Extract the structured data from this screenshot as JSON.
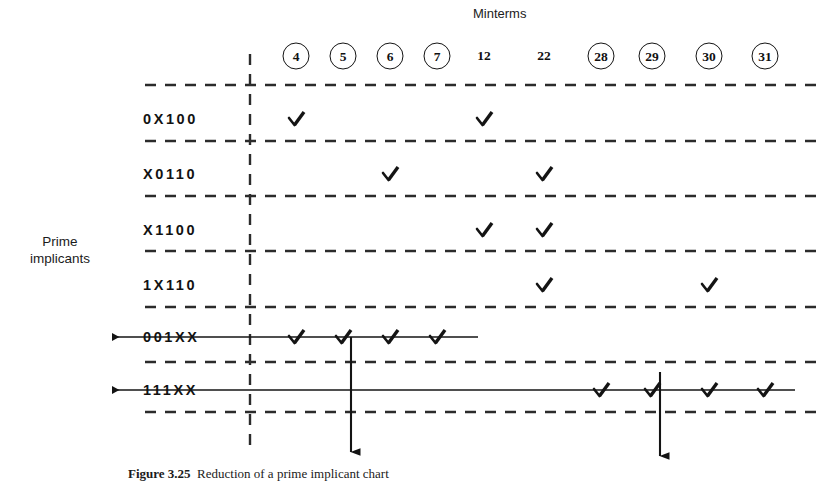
{
  "figure": {
    "header_label": "Minterms",
    "side_label_line1": "Prime",
    "side_label_line2": "implicants",
    "caption_bold": "Figure 3.25",
    "caption_text": "Reduction of a prime implicant chart",
    "ink_color": "#141414",
    "background_color": "#ffffff"
  },
  "chart_data": {
    "type": "table",
    "xlabel": "Minterms",
    "ylabel": "Prime implicants",
    "columns": [
      {
        "label": "4",
        "circled": true,
        "x": 296
      },
      {
        "label": "5",
        "circled": true,
        "x": 343
      },
      {
        "label": "6",
        "circled": true,
        "x": 390
      },
      {
        "label": "7",
        "circled": true,
        "x": 437
      },
      {
        "label": "12",
        "circled": false,
        "x": 484
      },
      {
        "label": "22",
        "circled": false,
        "x": 544
      },
      {
        "label": "28",
        "circled": true,
        "x": 601
      },
      {
        "label": "29",
        "circled": true,
        "x": 652
      },
      {
        "label": "30",
        "circled": true,
        "x": 709
      },
      {
        "label": "31",
        "circled": true,
        "x": 765
      }
    ],
    "rows": [
      {
        "label": "0X100",
        "struck": false,
        "y": 119,
        "marks": [
          "4",
          "12"
        ]
      },
      {
        "label": "X0110",
        "struck": false,
        "y": 174,
        "marks": [
          "6",
          "22"
        ]
      },
      {
        "label": "X1100",
        "struck": false,
        "y": 230,
        "marks": [
          "12",
          "22"
        ]
      },
      {
        "label": "1X110",
        "struck": false,
        "y": 285,
        "marks": [
          "22",
          "30"
        ]
      },
      {
        "label": "001XX",
        "struck": true,
        "y": 337,
        "marks": [
          "4",
          "5",
          "6",
          "7"
        ],
        "strike_end_x": 478
      },
      {
        "label": "111XX",
        "struck": true,
        "y": 390,
        "marks": [
          "28",
          "29",
          "30",
          "31"
        ],
        "strike_end_x": 795
      }
    ],
    "essential_columns": [
      "5",
      "29"
    ],
    "grid": "dashed",
    "legend": "none"
  }
}
